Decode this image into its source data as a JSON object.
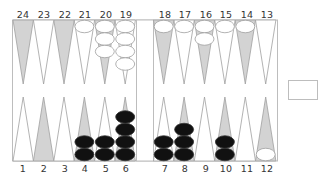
{
  "game": "Backgammon",
  "colors": {
    "frame": "#bdbdbd",
    "point_light": "#ffffff",
    "point_dark": "#d3d3d3",
    "point_stroke": "#a0a0a0",
    "checker_white_fill": "#ffffff",
    "checker_white_stroke": "#a0a0a0",
    "checker_black_fill": "#111111",
    "checker_black_stroke": "#333333"
  },
  "top_labels": [
    "24",
    "23",
    "22",
    "21",
    "20",
    "19",
    "18",
    "17",
    "16",
    "15",
    "14",
    "13"
  ],
  "bottom_labels": [
    "1",
    "2",
    "3",
    "4",
    "5",
    "6",
    "7",
    "8",
    "9",
    "10",
    "11",
    "12"
  ],
  "points": {
    "1": {
      "shade": "light",
      "color": null,
      "count": 0
    },
    "2": {
      "shade": "dark",
      "color": null,
      "count": 0
    },
    "3": {
      "shade": "light",
      "color": null,
      "count": 0
    },
    "4": {
      "shade": "dark",
      "color": "black",
      "count": 2
    },
    "5": {
      "shade": "light",
      "color": "black",
      "count": 2
    },
    "6": {
      "shade": "dark",
      "color": "black",
      "count": 4
    },
    "7": {
      "shade": "light",
      "color": "black",
      "count": 2
    },
    "8": {
      "shade": "dark",
      "color": "black",
      "count": 3
    },
    "9": {
      "shade": "light",
      "color": null,
      "count": 0
    },
    "10": {
      "shade": "dark",
      "color": "black",
      "count": 2
    },
    "11": {
      "shade": "light",
      "color": null,
      "count": 0
    },
    "12": {
      "shade": "dark",
      "color": "white",
      "count": 1
    },
    "13": {
      "shade": "light",
      "color": null,
      "count": 0
    },
    "14": {
      "shade": "dark",
      "color": "white",
      "count": 1
    },
    "15": {
      "shade": "light",
      "color": "white",
      "count": 1
    },
    "16": {
      "shade": "dark",
      "color": "white",
      "count": 2
    },
    "17": {
      "shade": "light",
      "color": "white",
      "count": 1
    },
    "18": {
      "shade": "dark",
      "color": "white",
      "count": 1
    },
    "19": {
      "shade": "light",
      "color": "white",
      "count": 4
    },
    "20": {
      "shade": "dark",
      "color": "white",
      "count": 3
    },
    "21": {
      "shade": "light",
      "color": "white",
      "count": 1
    },
    "22": {
      "shade": "dark",
      "color": null,
      "count": 0
    },
    "23": {
      "shade": "light",
      "color": null,
      "count": 0
    },
    "24": {
      "shade": "dark",
      "color": null,
      "count": 0
    }
  },
  "bar": {
    "white": 0,
    "black": 0
  },
  "side_box": {
    "label": ""
  }
}
